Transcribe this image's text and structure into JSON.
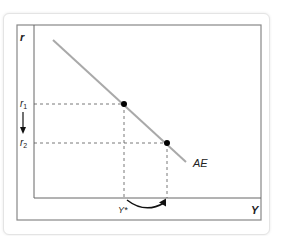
{
  "diagram": {
    "axis_labels": {
      "y": "r",
      "x": "Y"
    },
    "curve_label": "AE",
    "r_levels": [
      {
        "label": "r",
        "sub": "1"
      },
      {
        "label": "r",
        "sub": "2"
      }
    ],
    "output_label": "Y*",
    "colors": {
      "curve": "#a9a9a9",
      "frame": "#888888",
      "axes": "#666666",
      "dash": "#555555",
      "point": "#000000"
    },
    "points": [
      {
        "name": "r1-point",
        "x": 124,
        "y": 104
      },
      {
        "name": "r2-point",
        "x": 167,
        "y": 143
      }
    ]
  }
}
